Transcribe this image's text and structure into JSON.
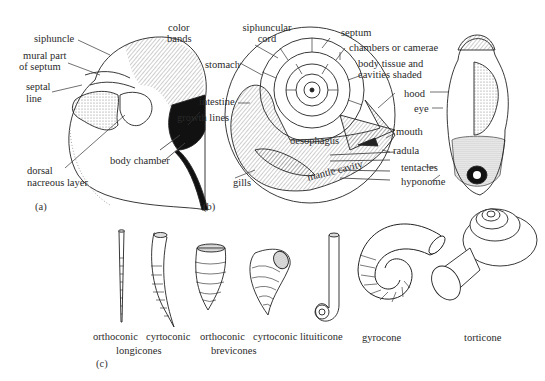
{
  "figure": {
    "panels": [
      "(a)",
      "(b)",
      "(c)"
    ]
  },
  "panel_a": {
    "title": "Nautilus shell external/cut view",
    "labels": {
      "siphuncle": "siphuncle",
      "mural_part": "mural part",
      "of_septum": "of septum",
      "septal": "septal",
      "line": "line",
      "color": "color",
      "bands": "bands",
      "growth_lines": "growth lines",
      "body_chamber": "body chamber",
      "dorsal": "dorsal",
      "nacreous_layer": "nacreous layer"
    }
  },
  "panel_b": {
    "labels": {
      "siphuncular": "siphuncular",
      "cord": "cord",
      "septum": "septum",
      "chambers": "chambers or camerae",
      "body_tissue": "body tissue and",
      "cavities": "cavities shaded",
      "stomach": "stomach",
      "intestine": "intestine",
      "hood": "hood",
      "eye": "eye",
      "mouth": "mouth",
      "oesophagus": "oesophagus",
      "radula": "radula",
      "tentacles": "tentacles",
      "hyponome": "hyponome",
      "gills": "gills",
      "mantle_cavity": "mantle cavity"
    }
  },
  "panel_c": {
    "shell_forms": [
      {
        "name": "orthoconic",
        "group": "longicones"
      },
      {
        "name": "cyrtoconic",
        "group": "longicones"
      },
      {
        "name": "orthoconic",
        "group": "brevicones"
      },
      {
        "name": "cyrtoconic",
        "group": "brevicones"
      },
      {
        "name": "lituiticone"
      },
      {
        "name": "gyrocone"
      },
      {
        "name": "torticone"
      }
    ],
    "group_labels": {
      "longicones": "longicones",
      "brevicones": "brevicones"
    }
  }
}
